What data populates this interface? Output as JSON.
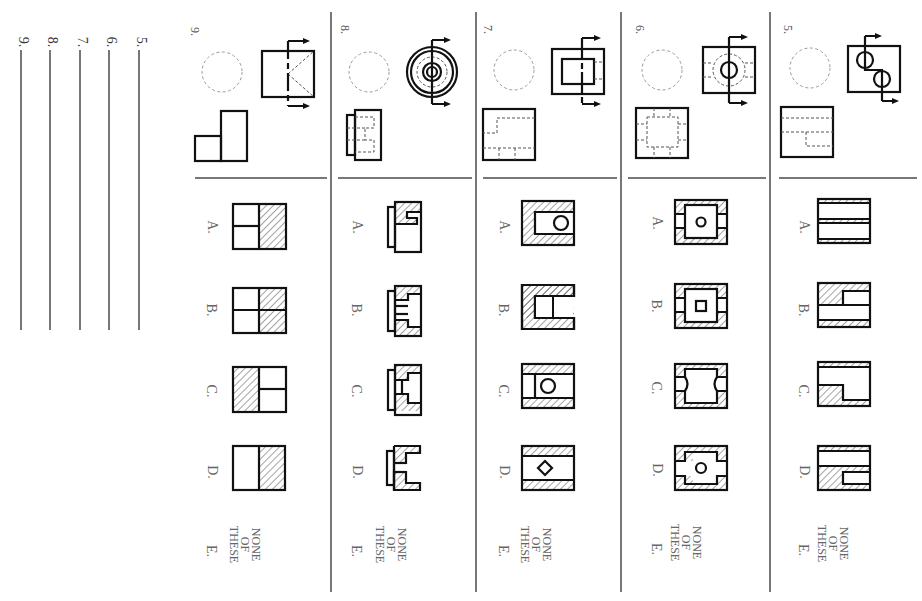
{
  "answer_blanks": [
    {
      "label": "5.",
      "x": 140
    },
    {
      "label": "6.",
      "x": 110
    },
    {
      "label": "7.",
      "x": 80
    },
    {
      "label": "8.",
      "x": 50
    },
    {
      "label": "9.",
      "x": 20
    }
  ],
  "problems": [
    {
      "number": "5.",
      "given": "Front view with offset section plane through two holes; side view with hidden lines (stepped bore)"
    },
    {
      "number": "6.",
      "given": "Front view with central hole and counterbore, cutting plane; side view square with hidden inner square"
    },
    {
      "number": "7.",
      "given": "Front view rectangle with inner rectangle and cutting plane; side view with hidden step lines"
    },
    {
      "number": "8.",
      "given": "Concentric circles front view with cutting plane; side view with hidden stepped lines"
    },
    {
      "number": "9.",
      "given": "Square front view with diagonal hidden lines and cutting plane; L-shaped side view"
    }
  ],
  "options": {
    "letters": [
      "A.",
      "B.",
      "C.",
      "D.",
      "E."
    ],
    "none_of_these": [
      "NONE",
      "OF",
      "THESE"
    ]
  },
  "colors": {
    "line": "#111111",
    "separator": "#777777",
    "text": "#666666",
    "background": "#ffffff"
  }
}
